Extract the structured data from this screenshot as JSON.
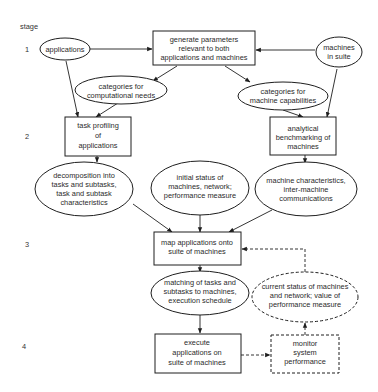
{
  "diagram": {
    "stage_header": "stage",
    "stages": [
      {
        "label": "1",
        "y": 49
      },
      {
        "label": "2",
        "y": 136
      },
      {
        "label": "3",
        "y": 244
      },
      {
        "label": "4",
        "y": 346
      }
    ],
    "nodes": {
      "applications": {
        "shape": "ellipse",
        "lines": [
          "applications"
        ]
      },
      "generate_parameters": {
        "shape": "box",
        "lines": [
          "generate parameters",
          "relevant to both",
          "applications and machines"
        ]
      },
      "machines_in_suite": {
        "shape": "ellipse",
        "lines": [
          "machines",
          "in suite"
        ]
      },
      "categories_computational": {
        "shape": "ellipse",
        "lines": [
          "categories for",
          "computational needs"
        ]
      },
      "categories_machine": {
        "shape": "ellipse",
        "lines": [
          "categories for",
          "machine capabilities"
        ]
      },
      "task_profiling": {
        "shape": "box",
        "lines": [
          "task profiling",
          "of",
          "applications"
        ]
      },
      "analytical_benchmarking": {
        "shape": "box",
        "lines": [
          "analytical",
          "benchmarking of",
          "machines"
        ]
      },
      "decomposition": {
        "shape": "ellipse",
        "lines": [
          "decomposition into",
          "tasks and subtasks,",
          "task and subtask",
          "characteristics"
        ]
      },
      "initial_status": {
        "shape": "ellipse",
        "lines": [
          "initial status of",
          "machines, network;",
          "performance measure"
        ]
      },
      "machine_characteristics": {
        "shape": "ellipse",
        "lines": [
          "machine characteristics,",
          "inter-machine",
          "communications"
        ]
      },
      "map_applications": {
        "shape": "box",
        "lines": [
          "map applications onto",
          "suite of machines"
        ]
      },
      "matching": {
        "shape": "ellipse",
        "lines": [
          "matching of tasks and",
          "subtasks to machines,",
          "execution schedule"
        ]
      },
      "current_status": {
        "shape": "ellipse",
        "style": "dashed",
        "lines": [
          "current status of machines",
          "and network; value of",
          "performance measure"
        ]
      },
      "execute": {
        "shape": "box",
        "lines": [
          "execute",
          "applications on",
          "suite of machines"
        ]
      },
      "monitor": {
        "shape": "box",
        "style": "dashed",
        "lines": [
          "monitor",
          "system",
          "performance"
        ]
      }
    },
    "edges": [
      {
        "from": "applications",
        "to": "generate_parameters",
        "style": "solid"
      },
      {
        "from": "machines_in_suite",
        "to": "generate_parameters",
        "style": "solid"
      },
      {
        "from": "generate_parameters",
        "to": "categories_computational",
        "style": "solid"
      },
      {
        "from": "generate_parameters",
        "to": "categories_machine",
        "style": "solid"
      },
      {
        "from": "applications",
        "to": "task_profiling",
        "style": "solid"
      },
      {
        "from": "categories_computational",
        "to": "task_profiling",
        "style": "solid"
      },
      {
        "from": "machines_in_suite",
        "to": "analytical_benchmarking",
        "style": "solid"
      },
      {
        "from": "categories_machine",
        "to": "analytical_benchmarking",
        "style": "solid"
      },
      {
        "from": "task_profiling",
        "to": "decomposition",
        "style": "solid"
      },
      {
        "from": "analytical_benchmarking",
        "to": "machine_characteristics",
        "style": "solid"
      },
      {
        "from": "decomposition",
        "to": "map_applications",
        "style": "solid"
      },
      {
        "from": "initial_status",
        "to": "map_applications",
        "style": "solid"
      },
      {
        "from": "machine_characteristics",
        "to": "map_applications",
        "style": "solid"
      },
      {
        "from": "map_applications",
        "to": "matching",
        "style": "solid"
      },
      {
        "from": "matching",
        "to": "execute",
        "style": "solid"
      },
      {
        "from": "execute",
        "to": "monitor",
        "style": "dashed"
      },
      {
        "from": "monitor",
        "to": "current_status",
        "style": "dashed"
      },
      {
        "from": "current_status",
        "to": "map_applications",
        "style": "dashed"
      }
    ]
  }
}
